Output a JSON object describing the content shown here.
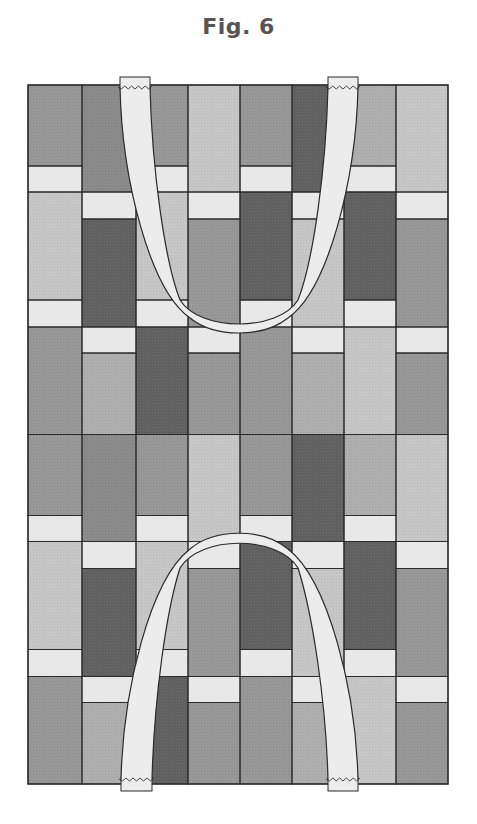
{
  "figure": {
    "title": "Fig. 6"
  },
  "colors": {
    "dark": "#616161",
    "medium_dark": "#8a8a8a",
    "medium": "#979797",
    "medium_light": "#aeaeae",
    "light": "#c6c6c6",
    "strip": "#e8e8e8",
    "handle": "#ececec",
    "outline": "#2a2a2a"
  },
  "grid": {
    "left": 28,
    "top": 85,
    "column_edges": [
      28,
      82,
      136,
      188,
      240,
      292,
      344,
      396,
      448
    ],
    "bottom": 784,
    "half_height": 349.5,
    "segments_even": [
      {
        "y0": 0,
        "y1": 81,
        "kind": "block",
        "row": 0
      },
      {
        "y0": 81,
        "y1": 107,
        "kind": "strip"
      },
      {
        "y0": 107,
        "y1": 215,
        "kind": "block",
        "row": 1
      },
      {
        "y0": 215,
        "y1": 242,
        "kind": "strip"
      },
      {
        "y0": 242,
        "y1": 349.5,
        "kind": "block",
        "row": 2
      }
    ],
    "segments_odd": [
      {
        "y0": 0,
        "y1": 107,
        "kind": "block",
        "row": 0
      },
      {
        "y0": 107,
        "y1": 134,
        "kind": "strip"
      },
      {
        "y0": 134,
        "y1": 242,
        "kind": "block",
        "row": 1
      },
      {
        "y0": 242,
        "y1": 268,
        "kind": "strip"
      },
      {
        "y0": 268,
        "y1": 349.5,
        "kind": "block",
        "row": 2
      }
    ],
    "block_tones": [
      [
        "medium",
        "medium_dark",
        "medium",
        "light",
        "medium",
        "dark",
        "medium_light",
        "light"
      ],
      [
        "light",
        "dark",
        "light",
        "medium",
        "dark",
        "light",
        "dark",
        "medium"
      ],
      [
        "medium",
        "medium_light",
        "dark",
        "medium",
        "medium",
        "medium_light",
        "light",
        "medium"
      ]
    ],
    "halves": 2
  },
  "handles": [
    {
      "name": "top-handle",
      "outer_path": "M120,87 C122,180 150,290 190,318 C215,338 263,338 288,318 C328,290 356,180 358,87",
      "inner_path": "M150,87 C152,170 165,262 180,300 C200,332 278,332 298,300 C313,262 326,170 328,87",
      "tabs": [
        {
          "x": 120,
          "y": 77,
          "w": 30,
          "h": 12,
          "zigzag_y": 87
        },
        {
          "x": 328,
          "y": 77,
          "w": 30,
          "h": 12,
          "zigzag_y": 87
        }
      ]
    },
    {
      "name": "bottom-handle",
      "outer_path": "M121,780 C123,690 150,580 190,549 C215,528 263,528 288,549 C328,580 356,690 358,780",
      "inner_path": "M152,780 C154,700 166,612 180,568 C200,535 278,535 298,568 C312,612 326,700 328,780",
      "tabs": [
        {
          "x": 121,
          "y": 778,
          "w": 31,
          "h": 13,
          "zigzag_y": 779
        },
        {
          "x": 328,
          "y": 778,
          "w": 30,
          "h": 13,
          "zigzag_y": 779
        }
      ]
    }
  ]
}
